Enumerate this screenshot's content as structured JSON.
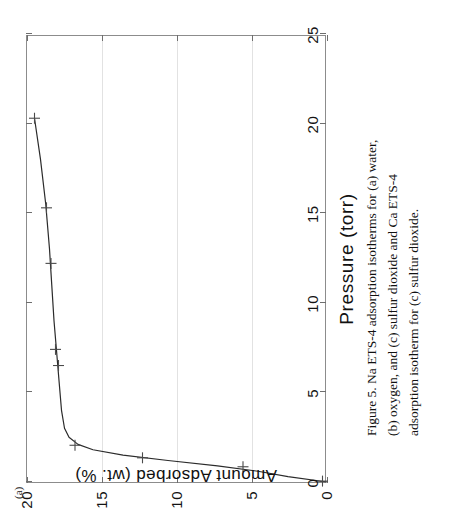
{
  "figure": {
    "panel_letter": "(a)",
    "caption": "Figure 5.  Na ETS-4 adsorption isotherms for (a) water, (b) oxygen, and (c) sulfur dioxide and Ca ETS-4 adsorption isotherm for (c) sulfur dioxide."
  },
  "chart_data": {
    "type": "line",
    "title": "",
    "xlabel": "Pressure (torr)",
    "ylabel": "Amount Adsorbed (wt. %)",
    "xlim": [
      0,
      25
    ],
    "ylim": [
      0,
      20
    ],
    "xticks": [
      0,
      5,
      10,
      15,
      20,
      25
    ],
    "xticklabels": [
      "0",
      "5",
      "10",
      "15",
      "20",
      "25"
    ],
    "yticks": [
      0,
      5,
      10,
      15,
      20
    ],
    "yticklabels": [
      "0",
      "5",
      "10",
      "15",
      "20"
    ],
    "grid": "horizontal-only-faint",
    "legend": "none",
    "series": [
      {
        "name": "Na ETS-4 water adsorption isotherm",
        "marker": "plus",
        "points": [
          {
            "x": 0.05,
            "y": 0.3
          },
          {
            "x": 0.85,
            "y": 5.6
          },
          {
            "x": 1.35,
            "y": 12.3
          },
          {
            "x": 2.05,
            "y": 16.8
          },
          {
            "x": 6.5,
            "y": 17.9
          },
          {
            "x": 7.4,
            "y": 18.1
          },
          {
            "x": 12.2,
            "y": 18.4
          },
          {
            "x": 15.3,
            "y": 18.7
          },
          {
            "x": 20.3,
            "y": 19.5
          }
        ],
        "fit_curve": [
          {
            "x": 0.0,
            "y": 0.0
          },
          {
            "x": 0.3,
            "y": 2.6
          },
          {
            "x": 0.6,
            "y": 4.6
          },
          {
            "x": 0.9,
            "y": 7.3
          },
          {
            "x": 1.2,
            "y": 10.6
          },
          {
            "x": 1.5,
            "y": 13.6
          },
          {
            "x": 1.8,
            "y": 15.6
          },
          {
            "x": 2.1,
            "y": 16.6
          },
          {
            "x": 2.5,
            "y": 17.2
          },
          {
            "x": 3.0,
            "y": 17.5
          },
          {
            "x": 4.0,
            "y": 17.7
          },
          {
            "x": 5.5,
            "y": 17.85
          },
          {
            "x": 7.0,
            "y": 18.0
          },
          {
            "x": 9.0,
            "y": 18.2
          },
          {
            "x": 11.0,
            "y": 18.35
          },
          {
            "x": 13.0,
            "y": 18.5
          },
          {
            "x": 15.5,
            "y": 18.75
          },
          {
            "x": 18.0,
            "y": 19.1
          },
          {
            "x": 20.3,
            "y": 19.5
          }
        ]
      }
    ]
  },
  "colors": {
    "curve": "#2b2b2b",
    "marker": "#4a4a4a",
    "frame": "#8c8c8c",
    "grid": "#e2e2e2",
    "text": "#111111",
    "background": "#ffffff"
  }
}
